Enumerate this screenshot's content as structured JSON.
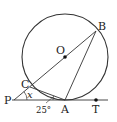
{
  "diagram": {
    "points": {
      "O": {
        "label": "O"
      },
      "A": {
        "label": "A"
      },
      "B": {
        "label": "B"
      },
      "C": {
        "label": "C"
      },
      "P": {
        "label": "P"
      },
      "T": {
        "label": "T"
      }
    },
    "angles": {
      "x": {
        "label": "x",
        "at": "P"
      },
      "CAP": {
        "label": "25°",
        "at": "A"
      }
    },
    "colors": {
      "stroke": "#333333",
      "background": "#ffffff"
    }
  }
}
